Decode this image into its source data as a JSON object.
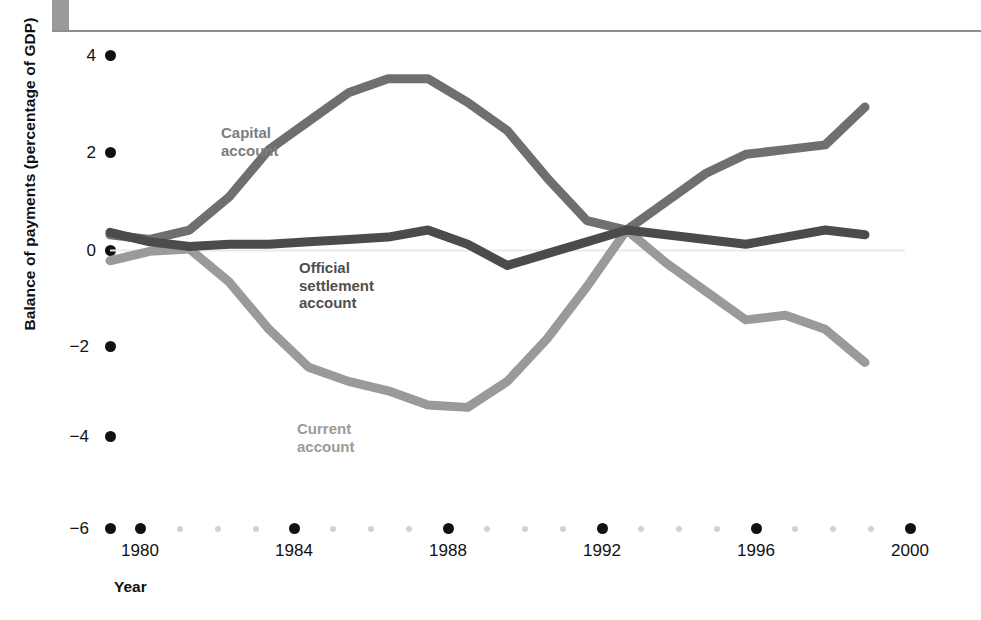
{
  "chart_data": {
    "type": "line",
    "title": "",
    "xlabel": "Year",
    "ylabel": "Balance of payments (percentage of GDP)",
    "xlim": [
      1979,
      2000
    ],
    "ylim": [
      -6,
      4
    ],
    "yticks": [
      4,
      2,
      0,
      -2,
      -4,
      -6
    ],
    "ytick_labels": [
      "4",
      "2",
      "0",
      "−2",
      "−4",
      "−6"
    ],
    "xticks": [
      1980,
      1984,
      1988,
      1992,
      1996,
      2000
    ],
    "xtick_labels": [
      "1980",
      "1984",
      "1988",
      "1992",
      "1996",
      "2000"
    ],
    "minor_xticks": [
      1979,
      1981,
      1982,
      1983,
      1985,
      1986,
      1987,
      1989,
      1990,
      1991,
      1993,
      1994,
      1995,
      1997,
      1998,
      1999
    ],
    "grid": false,
    "legend": "inline-labels",
    "zero_line": true,
    "x": [
      1979,
      1980,
      1981,
      1982,
      1983,
      1984,
      1985,
      1986,
      1987,
      1988,
      1989,
      1990,
      1991,
      1992,
      1993,
      1994,
      1995,
      1996,
      1997,
      1998
    ],
    "series": [
      {
        "name": "Capital account",
        "color": "#6f6f6f",
        "values": [
          0.2,
          0.1,
          0.3,
          1.0,
          2.0,
          2.6,
          3.2,
          3.5,
          3.5,
          3.0,
          2.4,
          1.4,
          0.5,
          0.3,
          0.9,
          1.5,
          1.9,
          2.0,
          2.1,
          2.9
        ]
      },
      {
        "name": "Official settlement account",
        "color": "#4b4b4b",
        "values": [
          0.25,
          0.05,
          -0.05,
          0.0,
          0.0,
          0.05,
          0.1,
          0.15,
          0.3,
          0.0,
          -0.45,
          -0.2,
          0.05,
          0.3,
          0.2,
          0.1,
          0.0,
          0.15,
          0.3,
          0.2
        ]
      },
      {
        "name": "Current account",
        "color": "#9a9a9a",
        "values": [
          -0.35,
          -0.15,
          -0.1,
          -0.8,
          -1.8,
          -2.6,
          -2.9,
          -3.1,
          -3.4,
          -3.45,
          -2.9,
          -2.0,
          -0.9,
          0.3,
          -0.4,
          -1.0,
          -1.6,
          -1.5,
          -1.8,
          -2.5
        ]
      }
    ]
  },
  "labels": {
    "capital_account": "Capital\naccount",
    "capital_account_line1": "Capital",
    "capital_account_line2": "account",
    "official_settlement_line1": "Official",
    "official_settlement_line2": "settlement",
    "official_settlement_line3": "account",
    "current_account_line1": "Current",
    "current_account_line2": "account",
    "y_axis_title": "Balance of payments (percentage of GDP)",
    "x_axis_title": "Year"
  },
  "axis": {
    "y_tick_0": "4",
    "y_tick_1": "2",
    "y_tick_2": "0",
    "y_tick_3": "−2",
    "y_tick_4": "−4",
    "y_tick_5": "−6",
    "x_tick_0": "1980",
    "x_tick_1": "1984",
    "x_tick_2": "1988",
    "x_tick_3": "1992",
    "x_tick_4": "1996",
    "x_tick_5": "2000"
  },
  "colors": {
    "capital": "#6f6f6f",
    "official": "#4b4b4b",
    "current": "#9a9a9a",
    "tick_major": "#111111",
    "tick_minor": "#d2d2d2",
    "zero_line": "#e8e8e8"
  }
}
